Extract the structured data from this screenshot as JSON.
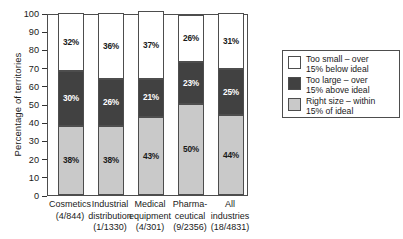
{
  "chart_data": {
    "type": "bar",
    "subtype": "stacked-bar-100",
    "title": "",
    "xlabel": "",
    "ylabel": "Percentage of territories",
    "ylim": [
      0,
      100
    ],
    "ytick_step": 10,
    "ytick_labels": [
      "100",
      "90",
      "80",
      "70",
      "60",
      "50",
      "40",
      "30",
      "20",
      "10",
      "0"
    ],
    "grid": false,
    "legend_position": "right",
    "categories": [
      "Cosmetics",
      "Industrial distribution",
      "Medical equipment",
      "Pharma- ceutical",
      "All industries"
    ],
    "category_lines": [
      [
        "Cosmetics",
        "(4/844)"
      ],
      [
        "Industrial",
        "distribution",
        "(1/1330)"
      ],
      [
        "Medical",
        "equipment",
        "(4/301)"
      ],
      [
        "Pharma-",
        "ceutical",
        "(9/2356)"
      ],
      [
        "All",
        "industries",
        "(18/4831)"
      ]
    ],
    "series": [
      {
        "name": "Right size – within 15% of ideal",
        "color": "#c9c9c9",
        "values": [
          38,
          38,
          43,
          50,
          44
        ],
        "labels": [
          "38%",
          "38%",
          "43%",
          "50%",
          "44%"
        ]
      },
      {
        "name": "Too large – over 15% above ideal",
        "color": "#414141",
        "values": [
          30,
          26,
          21,
          23,
          25
        ],
        "labels": [
          "30%",
          "26%",
          "21%",
          "23%",
          "25%"
        ]
      },
      {
        "name": "Too small – over 15% below ideal",
        "color": "#ffffff",
        "values": [
          32,
          36,
          37,
          26,
          31
        ],
        "labels": [
          "32%",
          "36%",
          "37%",
          "26%",
          "31%"
        ]
      }
    ],
    "legend_entries": [
      {
        "label": "Too small – over\n15% below ideal",
        "color": "#ffffff"
      },
      {
        "label": "Too large – over\n15% above ideal",
        "color": "#414141"
      },
      {
        "label": "Right size – within\n15% of ideal",
        "color": "#c9c9c9"
      }
    ]
  }
}
